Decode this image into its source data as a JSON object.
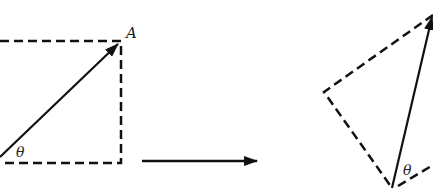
{
  "diagram": {
    "left_figure": {
      "point_label": "A",
      "angle_label": "θ"
    },
    "right_figure": {
      "angle_label": "θ"
    },
    "colors": {
      "stroke": "#111111",
      "background": "#ffffff"
    }
  }
}
